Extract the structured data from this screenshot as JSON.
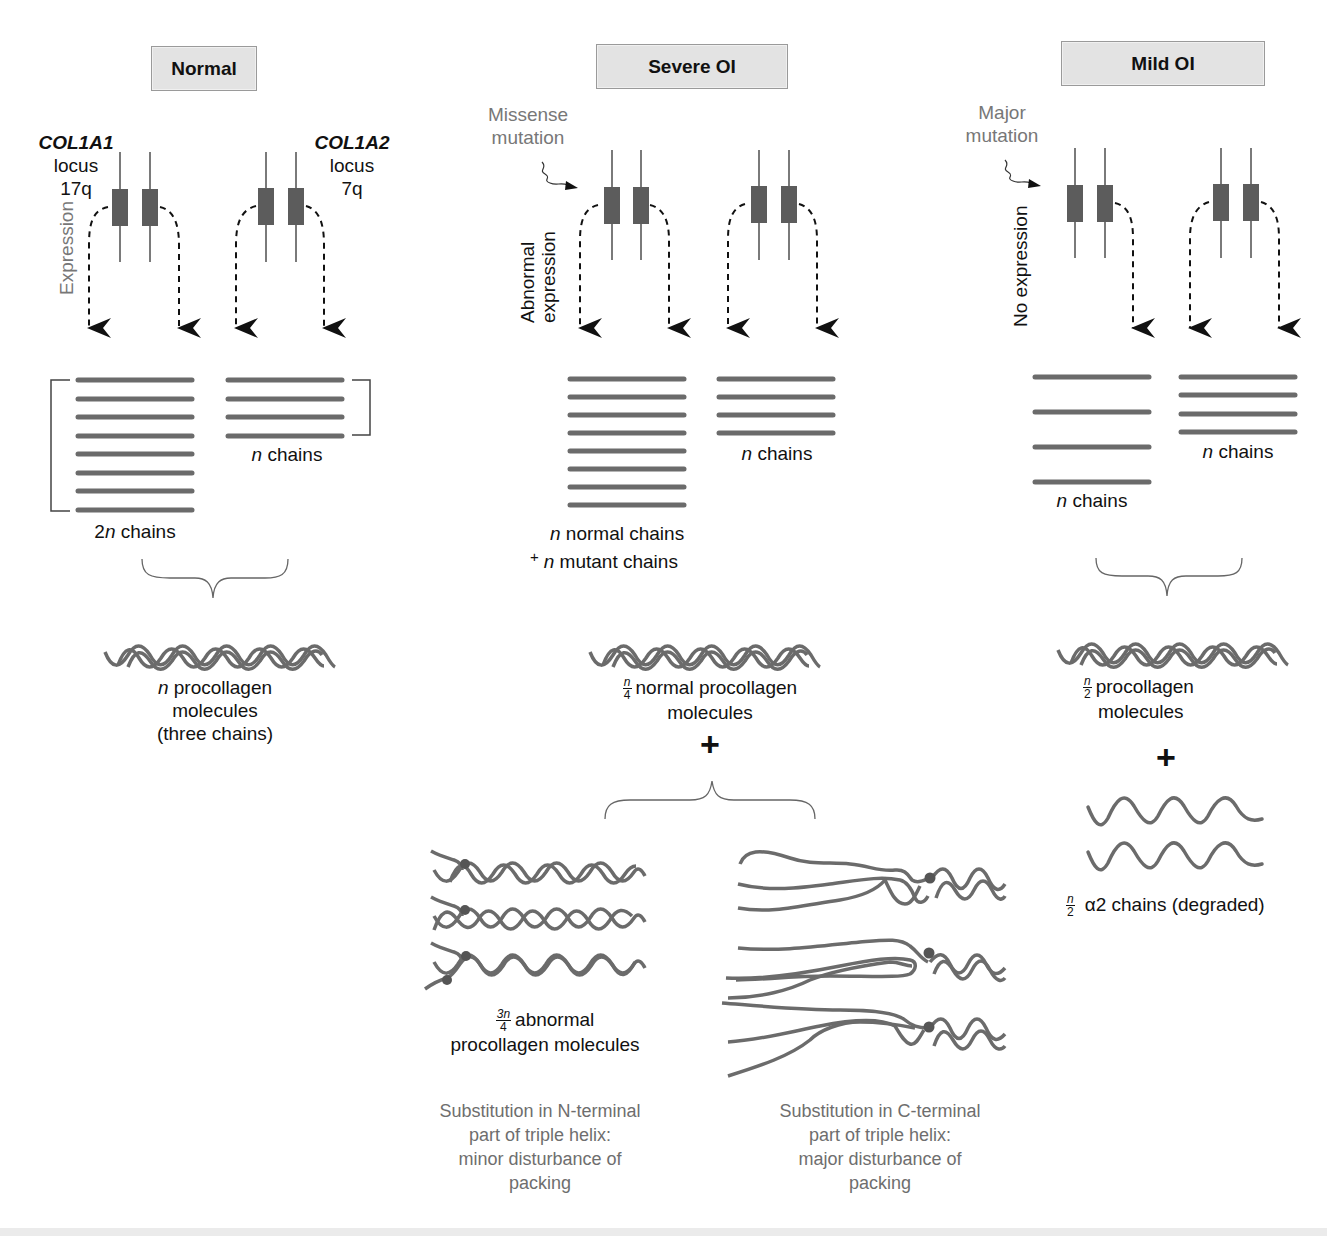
{
  "panels": {
    "normal": {
      "title": "Normal",
      "gene1": {
        "name": "COL1A1",
        "locus_word": "locus",
        "locus": "17q"
      },
      "gene2": {
        "name": "COL1A2",
        "locus_word": "locus",
        "locus": "7q"
      },
      "expression_label": "Expression",
      "chains_left": {
        "prefix": "2",
        "italic": "n",
        "suffix": " chains",
        "count": 8
      },
      "chains_right": {
        "italic": "n",
        "suffix": " chains",
        "count": 4
      },
      "result": {
        "italic": "n",
        "line1": " procollagen",
        "line2": "molecules",
        "line3": "(three chains)"
      }
    },
    "severe": {
      "title": "Severe OI",
      "mutation_label_1": "Missense",
      "mutation_label_2": "mutation",
      "expression_label_1": "Abnormal",
      "expression_label_2": "expression",
      "chains_left": {
        "line1_italic": "n",
        "line1": " normal chains",
        "plus": "+",
        "line2_italic": "n",
        "line2": " mutant chains",
        "count": 8
      },
      "chains_right": {
        "italic": "n",
        "suffix": " chains",
        "count": 4
      },
      "normal_result": {
        "frac_num": "n",
        "frac_den": "4",
        "line1": "normal procollagen",
        "line2": "molecules"
      },
      "plus": "+",
      "abnormal_result": {
        "frac_num": "3n",
        "frac_den": "4",
        "line1": "abnormal",
        "line2": "procollagen molecules"
      },
      "note_n_terminal": [
        "Substitution in N-terminal",
        "part of triple helix:",
        "minor disturbance of",
        "packing"
      ],
      "note_c_terminal": [
        "Substitution in C-terminal",
        "part of triple helix:",
        "major disturbance of",
        "packing"
      ]
    },
    "mild": {
      "title": "Mild OI",
      "mutation_label_1": "Major",
      "mutation_label_2": "mutation",
      "expression_label": "No expression",
      "chains_left": {
        "italic": "n",
        "suffix": " chains",
        "count": 4
      },
      "chains_right": {
        "italic": "n",
        "suffix": " chains",
        "count": 4
      },
      "result": {
        "frac_num": "n",
        "frac_den": "2",
        "line1": "procollagen",
        "line2": "molecules"
      },
      "plus": "+",
      "degraded": {
        "frac_num": "n",
        "frac_den": "2",
        "label": "α2 chains (degraded)"
      }
    }
  },
  "colors": {
    "chain": "#6b6b6b",
    "gene_box": "#5c5c5c",
    "title_bg": "#e3e3e3",
    "gray_text": "#777777",
    "arrow": "#111111"
  }
}
